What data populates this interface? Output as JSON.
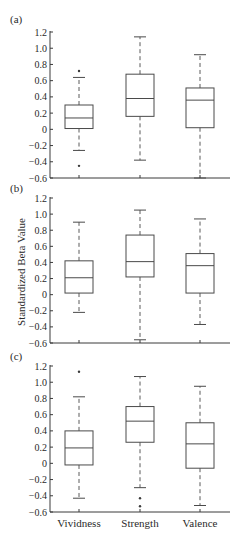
{
  "chart_data": [
    {
      "type": "box",
      "panel_label": "(a)",
      "title": "",
      "xlabel": "",
      "ylabel": "",
      "ylim": [
        -0.6,
        1.2
      ],
      "yticks": [
        1.2,
        1.0,
        0.8,
        0.6,
        0.4,
        0.2,
        0,
        -0.2,
        -0.4,
        -0.6
      ],
      "ytick_labels": [
        "1.2",
        "1.0",
        "0.8",
        "0.6",
        "0.4",
        "0.2",
        "0",
        "-0.2",
        "-0.4",
        "-0.6"
      ],
      "categories": [
        "Vividness",
        "Strength",
        "Valence"
      ],
      "show_category_labels": false,
      "grid": false,
      "series": [
        {
          "name": "Vividness",
          "whisker_low": -0.26,
          "q1": 0.01,
          "median": 0.14,
          "q3": 0.3,
          "whisker_high": 0.64,
          "outliers": [
            0.72,
            -0.45
          ]
        },
        {
          "name": "Strength",
          "whisker_low": -0.38,
          "q1": 0.16,
          "median": 0.38,
          "q3": 0.68,
          "whisker_high": 1.14,
          "outliers": []
        },
        {
          "name": "Valence",
          "whisker_low": -0.6,
          "q1": 0.02,
          "median": 0.36,
          "q3": 0.51,
          "whisker_high": 0.92,
          "outliers": []
        }
      ]
    },
    {
      "type": "box",
      "panel_label": "(b)",
      "title": "",
      "xlabel": "",
      "ylabel": "Standardized Beta Value",
      "ylim": [
        -0.6,
        1.2
      ],
      "yticks": [
        1.2,
        1.0,
        0.8,
        0.6,
        0.4,
        0.2,
        0,
        -0.2,
        -0.4,
        -0.6
      ],
      "ytick_labels": [
        "1.2",
        "1.0",
        "0.8",
        "0.6",
        "0.4",
        "0.2",
        "0",
        "-0.2",
        "-0.4",
        "-0.6"
      ],
      "categories": [
        "Vividness",
        "Strength",
        "Valence"
      ],
      "show_category_labels": false,
      "grid": false,
      "series": [
        {
          "name": "Vividness",
          "whisker_low": -0.22,
          "q1": 0.02,
          "median": 0.21,
          "q3": 0.42,
          "whisker_high": 0.9,
          "outliers": []
        },
        {
          "name": "Strength",
          "whisker_low": -0.56,
          "q1": 0.22,
          "median": 0.41,
          "q3": 0.74,
          "whisker_high": 1.05,
          "outliers": []
        },
        {
          "name": "Valence",
          "whisker_low": -0.37,
          "q1": 0.02,
          "median": 0.36,
          "q3": 0.51,
          "whisker_high": 0.94,
          "outliers": []
        }
      ]
    },
    {
      "type": "box",
      "panel_label": "(c)",
      "title": "",
      "xlabel": "",
      "ylabel": "",
      "ylim": [
        -0.6,
        1.2
      ],
      "yticks": [
        1.2,
        1.0,
        0.8,
        0.6,
        0.4,
        0.2,
        0,
        -0.2,
        -0.4,
        -0.6
      ],
      "ytick_labels": [
        "1.2",
        "1.0",
        "0.8",
        "0.6",
        "0.4",
        "0.2",
        "0",
        "-0.2",
        "-0.4",
        "-0.6"
      ],
      "categories": [
        "Vividness",
        "Strength",
        "Valence"
      ],
      "show_category_labels": true,
      "grid": false,
      "series": [
        {
          "name": "Vividness",
          "whisker_low": -0.43,
          "q1": -0.02,
          "median": 0.19,
          "q3": 0.4,
          "whisker_high": 0.82,
          "outliers": [
            1.13
          ]
        },
        {
          "name": "Strength",
          "whisker_low": -0.3,
          "q1": 0.26,
          "median": 0.52,
          "q3": 0.7,
          "whisker_high": 1.07,
          "outliers": [
            -0.43,
            -0.53
          ]
        },
        {
          "name": "Valence",
          "whisker_low": -0.52,
          "q1": -0.06,
          "median": 0.24,
          "q3": 0.5,
          "whisker_high": 0.95,
          "outliers": []
        }
      ]
    }
  ],
  "figure": {
    "shared_ylabel": "Standardized Beta Value",
    "category_labels": [
      "Vividness",
      "Strength",
      "Valence"
    ],
    "colors": {
      "axis": "#3a3a3a",
      "box": "#4a4a4a",
      "text": "#2a2a2a",
      "background": "#ffffff"
    }
  }
}
